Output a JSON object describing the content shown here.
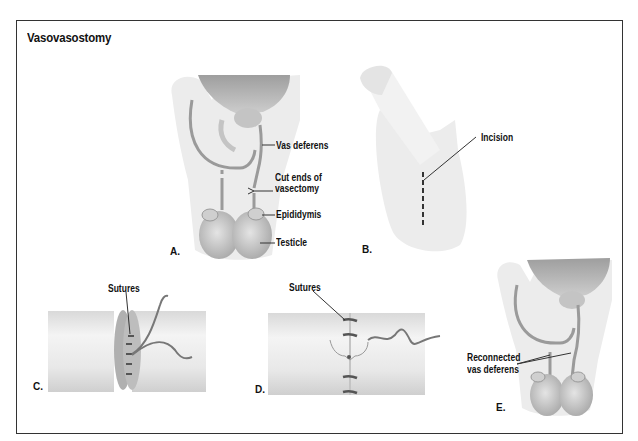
{
  "title": "Vasovasostomy",
  "panels": [
    {
      "letter": "A.",
      "labels": [
        "Vas deferens",
        "Cut ends of",
        "vasectomy",
        "Epididymis",
        "Testicle"
      ]
    },
    {
      "letter": "B.",
      "labels": [
        "Incision"
      ]
    },
    {
      "letter": "C.",
      "labels": [
        "Sutures"
      ]
    },
    {
      "letter": "D.",
      "labels": [
        "Sutures"
      ]
    },
    {
      "letter": "E.",
      "labels": [
        "Reconnected",
        "vas deferens"
      ]
    }
  ],
  "colors": {
    "frame": "#333333",
    "tissue_light": "#ececec",
    "tissue_mid": "#d6d6d6",
    "organ": "#bdbdbd",
    "vas": "#9a9a9a",
    "suture": "#555555"
  }
}
